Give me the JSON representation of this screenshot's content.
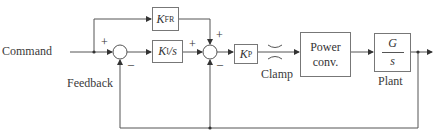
{
  "diagram": {
    "type": "control-loop block diagram",
    "inputs": {
      "command_label": "Command",
      "feedback_label": "Feedback"
    },
    "blocks": {
      "kfr": {
        "symbol": "K",
        "subscript": "FR"
      },
      "ki": {
        "symbol": "K",
        "subscript": "I",
        "suffix": " /s"
      },
      "kp": {
        "symbol": "K",
        "subscript": "P"
      },
      "clamp": {
        "label": "Clamp"
      },
      "power_conv": {
        "line1": "Power",
        "line2": "conv."
      },
      "plant": {
        "numerator": "G",
        "denominator": "s",
        "label": "Plant"
      }
    },
    "summing_junctions": {
      "sum1": {
        "plus": "+",
        "minus": "–"
      },
      "sum2": {
        "plus_top": "+",
        "plus_left": "+",
        "minus": "–"
      }
    },
    "colors": {
      "line": "#555555",
      "box_border": "#777777",
      "background": "#ffffff"
    }
  }
}
